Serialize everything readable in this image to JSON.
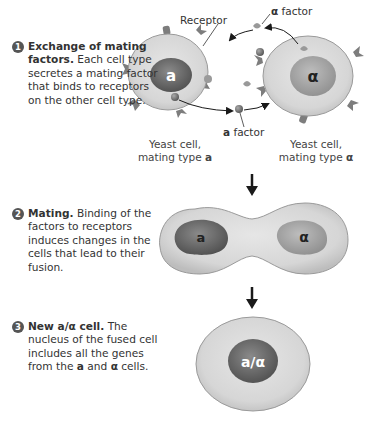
{
  "steps": [
    {
      "number": "1",
      "title": "Exchange of mating factors.",
      "text": "Each cell type secretes a mating factor that binds to receptors on the other cell type."
    },
    {
      "number": "2",
      "title": "Mating.",
      "text": "Binding of the factors to receptors induces changes in the cells that lead to their fusion."
    },
    {
      "number": "3",
      "title": "New a/α cell.",
      "text_pre": "The nucleus of the fused cell includes all the genes from the",
      "text_a": "a",
      "text_and": "and",
      "text_alpha": "α",
      "text_post": "cells."
    }
  ],
  "labels": {
    "receptor": "Receptor",
    "alpha_factor_symbol": "α",
    "alpha_factor_word": "factor",
    "a_factor_symbol": "a",
    "a_factor_word": "factor",
    "cell_a_line1": "Yeast cell,",
    "cell_a_line2": "mating type",
    "cell_a_type": "a",
    "cell_alpha_line1": "Yeast cell,",
    "cell_alpha_line2": "mating type",
    "cell_alpha_type": "α"
  },
  "nuclei": {
    "cell_a": "a",
    "cell_alpha": "α",
    "fused_a": "a",
    "fused_alpha": "α",
    "diploid": "a/α"
  },
  "colors": {
    "cytoplasm": "#d6d6d6",
    "cell_outline": "#9a9a9a",
    "nucleus_a": "#6e6e6e",
    "nucleus_alpha": "#a8a8a8",
    "nucleus_diploid": "#777777",
    "receptor": "#7d7d7d",
    "badge": "#555555",
    "arrow": "#1a1a1a"
  }
}
